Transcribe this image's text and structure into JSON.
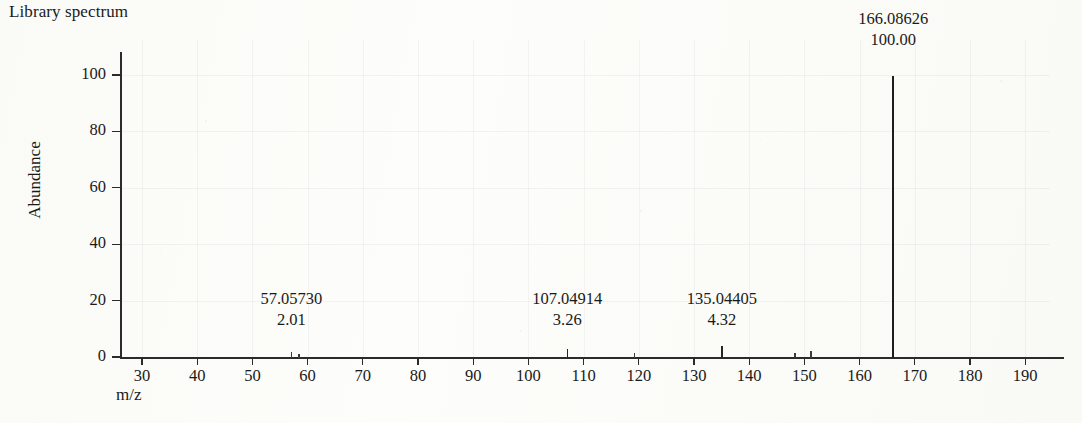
{
  "title": "Library spectrum",
  "axes": {
    "y_label": "Abundance",
    "x_label": "m/z",
    "y_ticks": [
      "0",
      "20",
      "40",
      "60",
      "80",
      "100"
    ],
    "x_ticks": [
      "30",
      "40",
      "50",
      "60",
      "70",
      "80",
      "90",
      "100",
      "110",
      "120",
      "130",
      "140",
      "150",
      "160",
      "170",
      "180",
      "190"
    ]
  },
  "annotations": [
    {
      "mz": "57.05730",
      "abundance": "2.01"
    },
    {
      "mz": "107.04914",
      "abundance": "3.26"
    },
    {
      "mz": "135.04405",
      "abundance": "4.32"
    },
    {
      "mz": "166.08626",
      "abundance": "100.00"
    }
  ],
  "chart_data": {
    "type": "bar",
    "title": "Library spectrum",
    "xlabel": "m/z",
    "ylabel": "Abundance",
    "xlim": [
      25,
      195
    ],
    "ylim": [
      0,
      105
    ],
    "grid": true,
    "legend": "none",
    "categories": [
      57.0573,
      58.4,
      107.04914,
      119.2,
      135.04405,
      148.3,
      151.2,
      166.08626
    ],
    "values": [
      2.01,
      1.6,
      3.26,
      1.9,
      4.32,
      1.8,
      2.4,
      100.0
    ],
    "labeled_peaks": [
      {
        "mz": 57.0573,
        "label_mz": "57.05730",
        "abundance": 2.01,
        "label_abundance": "2.01"
      },
      {
        "mz": 107.04914,
        "label_mz": "107.04914",
        "abundance": 3.26,
        "label_abundance": "3.26"
      },
      {
        "mz": 135.04405,
        "label_mz": "135.04405",
        "abundance": 4.32,
        "label_abundance": "4.32"
      },
      {
        "mz": 166.08626,
        "label_mz": "166.08626",
        "abundance": 100.0,
        "label_abundance": "100.00"
      }
    ],
    "unlabeled_peaks": [
      {
        "mz": 58.4,
        "abundance": 1.6
      },
      {
        "mz": 119.2,
        "abundance": 1.9
      },
      {
        "mz": 148.3,
        "abundance": 1.8
      },
      {
        "mz": 151.2,
        "abundance": 2.4
      }
    ],
    "base_peak": {
      "mz": 166.08626,
      "abundance": 100.0
    }
  },
  "colors": {
    "ink": "#262626",
    "paper": "#fdfdfb",
    "grid": "rgba(120,125,130,0.075)"
  }
}
